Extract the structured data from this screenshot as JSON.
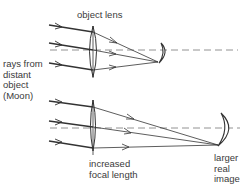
{
  "diagram": {
    "type": "optics-ray-diagram",
    "top": {
      "lens_label": "object lens",
      "description": "short focal length produces small real image"
    },
    "left_label_lines": [
      "rays from",
      "distant",
      "object",
      "(Moon)"
    ],
    "bottom": {
      "lens_label_lines": [
        "increased",
        "focal length"
      ],
      "image_label_lines": [
        "larger",
        "real",
        "image"
      ]
    },
    "colors": {
      "line": "#333333",
      "axis": "#777777",
      "background": "#ffffff"
    }
  }
}
